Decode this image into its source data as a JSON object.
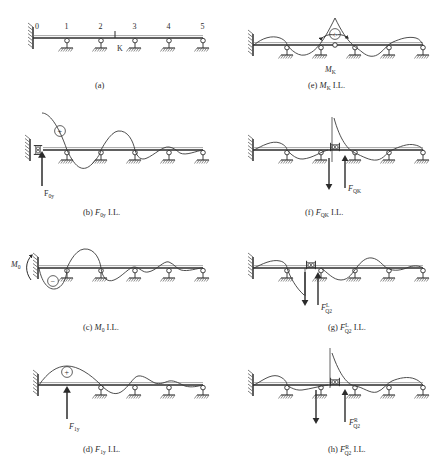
{
  "figure": {
    "beam_nodes": [
      "0",
      "1",
      "2",
      "3",
      "4",
      "5"
    ],
    "section_label": "K",
    "line_color": "#3a3a3a",
    "beam_color": "#2b2b2b",
    "hatch_color": "#5a5a5a",
    "panels": [
      {
        "id": "a",
        "caption": "(a)",
        "caption_prefix": "(a)",
        "quantity": "",
        "quantity_sub": "",
        "quantity_sup": "",
        "il_suffix": "",
        "force_label": "",
        "force_label_sub": "",
        "force_label_sup": "",
        "sign": ""
      },
      {
        "id": "b",
        "caption": "(b)  F0y I.L.",
        "caption_prefix": "(b)",
        "quantity": "F",
        "quantity_sub": "0y",
        "quantity_sup": "",
        "il_suffix": "I.L.",
        "force_label": "F",
        "force_label_sub": "0y",
        "force_label_sup": "",
        "sign": "+"
      },
      {
        "id": "c",
        "caption": "(c)  M0 I.L.",
        "caption_prefix": "(c)",
        "quantity": "M",
        "quantity_sub": "0",
        "quantity_sup": "",
        "il_suffix": "I.L.",
        "force_label": "M",
        "force_label_sub": "0",
        "force_label_sup": "",
        "sign": "−"
      },
      {
        "id": "d",
        "caption": "(d)  F1y I.L.",
        "caption_prefix": "(d)",
        "quantity": "F",
        "quantity_sub": "1y",
        "quantity_sup": "",
        "il_suffix": "I.L.",
        "force_label": "F",
        "force_label_sub": "1y",
        "force_label_sup": "",
        "sign": "+"
      },
      {
        "id": "e",
        "caption": "(e)  MK I.L.",
        "caption_prefix": "(e)",
        "quantity": "M",
        "quantity_sub": "K",
        "quantity_sup": "",
        "il_suffix": "I.L.",
        "force_label": "M",
        "force_label_sub": "K",
        "force_label_sup": "",
        "sign": "+"
      },
      {
        "id": "f",
        "caption": "(f)  FQK I.L.",
        "caption_prefix": "(f)",
        "quantity": "F",
        "quantity_sub": "QK",
        "quantity_sup": "",
        "il_suffix": "I.L.",
        "force_label": "F",
        "force_label_sub": "QK",
        "force_label_sup": "",
        "sign": ""
      },
      {
        "id": "g",
        "caption": "(g)  FQ2 L I.L.",
        "caption_prefix": "(g)",
        "quantity": "F",
        "quantity_sub": "Q2",
        "quantity_sup": "L",
        "il_suffix": "I.L.",
        "force_label": "F",
        "force_label_sub": "Q2",
        "force_label_sup": "L",
        "sign": ""
      },
      {
        "id": "h",
        "caption": "(h)  FQ2 R I.L.",
        "caption_prefix": "(h)",
        "quantity": "F",
        "quantity_sub": "Q2",
        "quantity_sup": "R",
        "il_suffix": "I.L.",
        "force_label": "F",
        "force_label_sub": "Q2",
        "force_label_sup": "R",
        "sign": ""
      }
    ]
  }
}
